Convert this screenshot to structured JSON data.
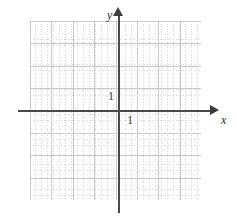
{
  "figure": {
    "kind": "coordinate-plane",
    "background_color": "#ffffff"
  },
  "axes": {
    "x": {
      "name": "x",
      "arrow": "right-arrow-icon",
      "color": "#4a4a4a",
      "tick_label": "1"
    },
    "y": {
      "name": "y",
      "arrow": "up-arrow-icon",
      "color": "#4a4a4a",
      "tick_label": "1"
    }
  },
  "grid": {
    "major_color": "#c9c9c9",
    "minor_color": "#d8d8d8",
    "major_cells_x": 8,
    "major_cells_y": 8,
    "minor_per_major": 4,
    "style": "major-solid-minor-dotted"
  },
  "chart_data": {
    "type": "scatter",
    "title": "",
    "subtitle": "",
    "xlabel": "x",
    "ylabel": "y",
    "xlim": [
      -4,
      4
    ],
    "ylim": [
      -4,
      4
    ],
    "xticks": [
      -4,
      -3,
      -2,
      -1,
      0,
      1,
      2,
      3,
      4
    ],
    "yticks": [
      -4,
      -3,
      -2,
      -1,
      0,
      1,
      2,
      3,
      4
    ],
    "xtick_labels": [
      "",
      "",
      "",
      "",
      "",
      "1",
      "",
      "",
      ""
    ],
    "ytick_labels": [
      "",
      "",
      "",
      "",
      "",
      "1",
      "",
      "",
      ""
    ],
    "grid": true,
    "legend": null,
    "series": [],
    "annotations": []
  }
}
